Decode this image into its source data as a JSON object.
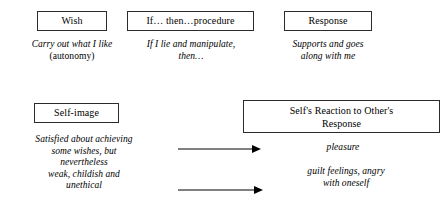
{
  "diagram": {
    "boxes": {
      "wish": "Wish",
      "procedure": "If… then…procedure",
      "response": "Response",
      "self_image": "Self-image",
      "reaction": "Self's Reaction to Other's\nResponse"
    },
    "captions": {
      "wish_italic": "Carry out what I like",
      "wish_roman": "(autonomy)",
      "procedure": "If I lie and manipulate,\nthen…",
      "response": "Supports and goes\nalong with me",
      "self_image": "Satisfied about achieving\nsome wishes, but\nnevertheless\nweak, childish and\nunethical",
      "pleasure": "pleasure",
      "guilt": "guilt feelings, angry\nwith oneself"
    },
    "arrows": {
      "top_label": "arrow from self-image to pleasure",
      "bottom_label": "arrow from self-image to guilt feelings"
    },
    "colors": {
      "ink": "#000000",
      "border": "#2b2b2b",
      "background": "#ffffff"
    }
  }
}
